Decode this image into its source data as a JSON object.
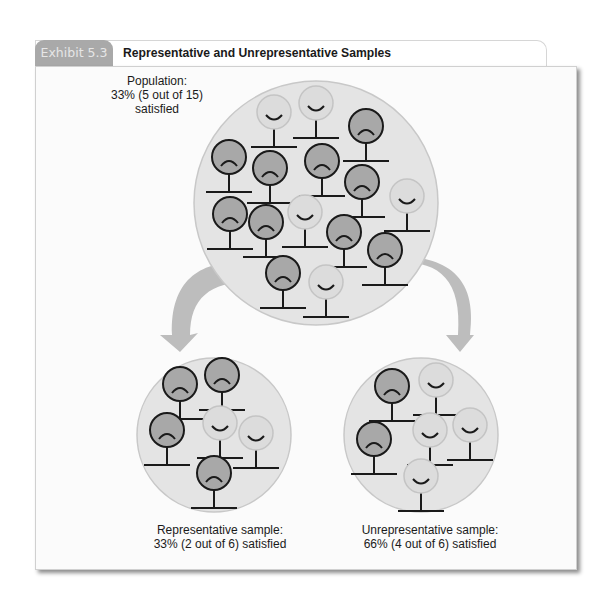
{
  "exhibit": {
    "tab_label": "Exhibit 5.3",
    "title": "Representative and Unrepresentative Samples"
  },
  "population": {
    "caption_line1": "Population:",
    "caption_line2": "33% (5 out of 15)",
    "caption_line3": "satisfied",
    "total": 15,
    "satisfied": 5,
    "percent_satisfied": 33
  },
  "representative_sample": {
    "caption_line1": "Representative sample:",
    "caption_line2": "33% (2 out of 6) satisfied",
    "total": 6,
    "satisfied": 2,
    "percent_satisfied": 33
  },
  "unrepresentative_sample": {
    "caption_line1": "Unrepresentative sample:",
    "caption_line2": "66% (4 out of 6) satisfied",
    "total": 6,
    "satisfied": 4,
    "percent_satisfied": 66
  },
  "legend_icons": {
    "satisfied": "happy-face-figure",
    "unsatisfied": "sad-face-figure"
  },
  "colors": {
    "satisfied_fill": "#dcdcdc",
    "unsatisfied_fill": "#a8a8a8",
    "group_circle_fill": "#e4e4e4",
    "arrow_fill": "#bdbdbd",
    "tab_fill": "#a9a9a9"
  }
}
